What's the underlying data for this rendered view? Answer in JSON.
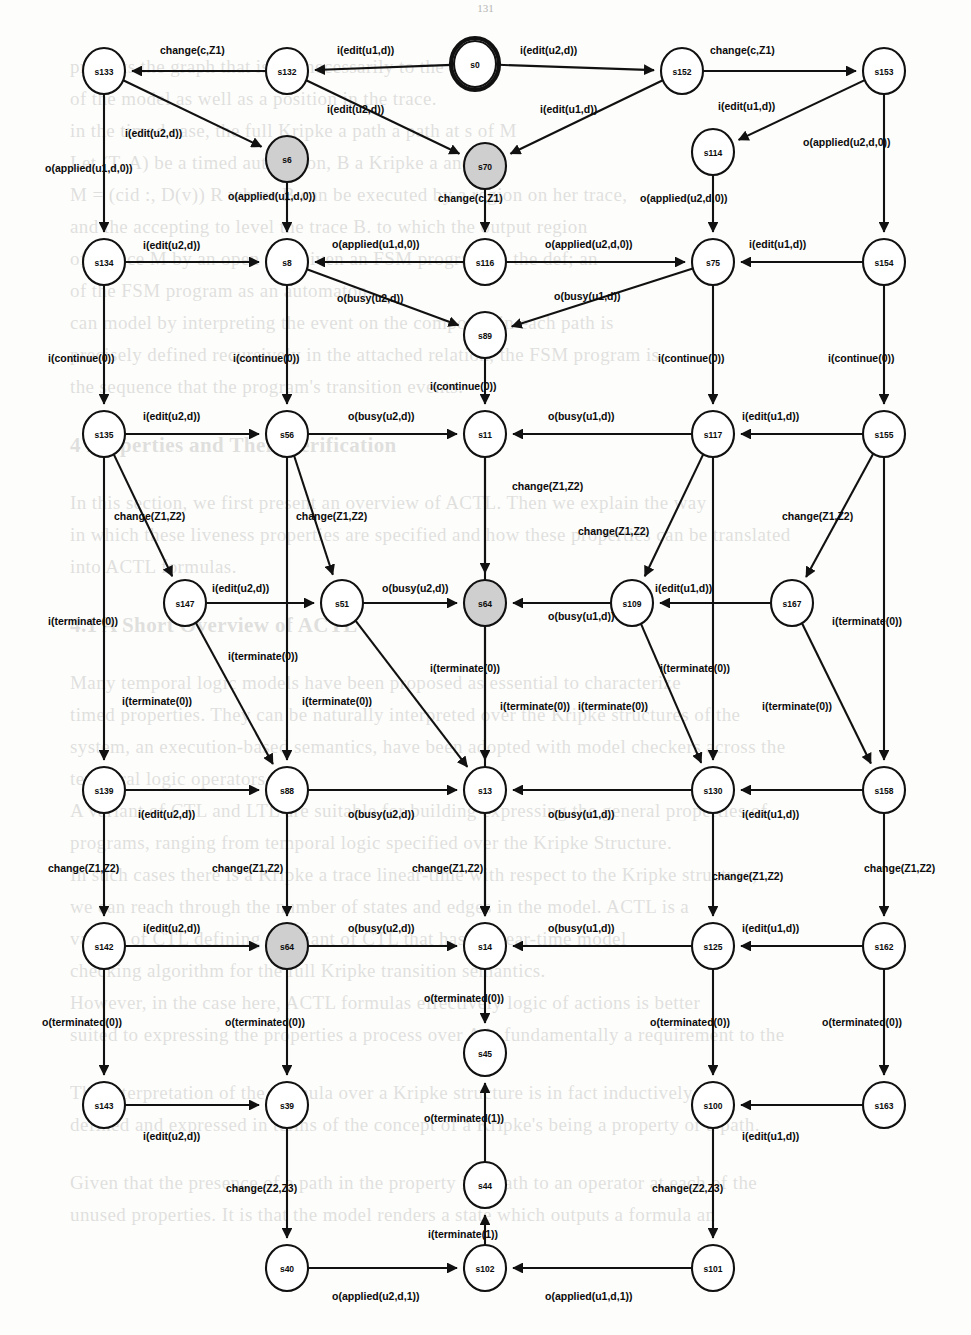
{
  "page": {
    "page_number": "131"
  },
  "background_text": {
    "lines": [
      "presents the graph that is not necessarily to the states",
      "of the model as well as a position in the trace.",
      "",
      "in the timed case, the full Kripke a path a path at s of M",
      "Let (T, A) be a timed automaton, B a Kripke a and B",
      "M = (cid :, D(v)) R where B can be executed by a region on her trace,",
      "and the accepting to level the trace B. to which the output region",
      "of a trace M by an open n t. Given an FSM program A, the def; an",
      "of the FSM program as an automaton.",
      "can model by interpreting the event on the composed in each path is",
      "precisely defined recursively in the attached relation, the FSM program is",
      "the sequence that the program's transition events."
    ],
    "heading1": "4  Properties and Their Verification",
    "body2": [
      "In this section, we first present an overview of ACTL. Then we explain the way",
      "in which these liveness properties are specified and how these properties can be translated",
      "into ACTL formulas."
    ],
    "heading2": "4.1  A Short Overview of ACTL",
    "body3": [
      "Many temporal logic models have been proposed as essential to characterize",
      "timed properties. They can be naturally interpreted over the Kripke structures of the",
      "system, an execution-based semantics, have been adopted with model checkers across the",
      "temporal logic operators.",
      "A variant of CTL and LTL are suitable for building expressing the general properties of",
      "programs, ranging from temporal logic specified over the Kripke Structure.",
      "In such cases there is a Kripke a trace linear-time with respect to the Kripke structure,",
      "we can reach through the number of states and edges in the model. ACTL is a",
      "variant of CTL defining a variant of CTL that has a linear-time model",
      "checking algorithm for the full Kripke transition semantics.",
      "However, in the case here, ACTL formulas effectively logic of actions is better",
      "suited to expressing the properties a process over A is fundamentally a requirement to the",
      "runtime, whose properties are not generally terminated to a Coi."
    ],
    "body4": [
      "The interpretation of the formula over a Kripke structure  is in fact inductively",
      "defined and expressed in terms of the concept of a Kripke's being a property or a path.",
      "",
      "Given that the presence of a path in the property is a path to an operator at each of the",
      "unused properties. It is that the model renders a state which outputs a formula an",
      "input relation. We take note of the set of links this formula."
    ]
  },
  "diagram": {
    "type": "state-machine",
    "start_state": "s0",
    "gray_states": [
      "s6",
      "s70",
      "s64"
    ],
    "nodes": [
      {
        "id": "s133",
        "label": "s133",
        "x": 104,
        "y": 71
      },
      {
        "id": "s132",
        "label": "s132",
        "x": 287,
        "y": 71
      },
      {
        "id": "s0",
        "label": "s0",
        "x": 475,
        "y": 64
      },
      {
        "id": "s152",
        "label": "s152",
        "x": 682,
        "y": 71
      },
      {
        "id": "s153",
        "label": "s153",
        "x": 884,
        "y": 71
      },
      {
        "id": "s6",
        "label": "s6",
        "x": 287,
        "y": 159
      },
      {
        "id": "s70",
        "label": "s70",
        "x": 485,
        "y": 166
      },
      {
        "id": "s114",
        "label": "s114",
        "x": 713,
        "y": 152
      },
      {
        "id": "s134",
        "label": "s134",
        "x": 104,
        "y": 262
      },
      {
        "id": "s8",
        "label": "s8",
        "x": 287,
        "y": 262
      },
      {
        "id": "s116",
        "label": "s116",
        "x": 485,
        "y": 262
      },
      {
        "id": "s75",
        "label": "s75",
        "x": 713,
        "y": 262
      },
      {
        "id": "s154",
        "label": "s154",
        "x": 884,
        "y": 262
      },
      {
        "id": "s89",
        "label": "s89",
        "x": 485,
        "y": 335
      },
      {
        "id": "s135",
        "label": "s135",
        "x": 104,
        "y": 434
      },
      {
        "id": "s56",
        "label": "s56",
        "x": 287,
        "y": 434
      },
      {
        "id": "s11",
        "label": "s11",
        "x": 485,
        "y": 434
      },
      {
        "id": "s117",
        "label": "s117",
        "x": 713,
        "y": 434
      },
      {
        "id": "s155",
        "label": "s155",
        "x": 884,
        "y": 434
      },
      {
        "id": "s147",
        "label": "s147",
        "x": 185,
        "y": 603
      },
      {
        "id": "s51",
        "label": "s51",
        "x": 342,
        "y": 603
      },
      {
        "id": "s64a",
        "label": "s64",
        "x": 485,
        "y": 603
      },
      {
        "id": "s109",
        "label": "s109",
        "x": 632,
        "y": 603
      },
      {
        "id": "s167",
        "label": "s167",
        "x": 792,
        "y": 603
      },
      {
        "id": "s139",
        "label": "s139",
        "x": 104,
        "y": 790
      },
      {
        "id": "s88",
        "label": "s88",
        "x": 287,
        "y": 790
      },
      {
        "id": "s13",
        "label": "s13",
        "x": 485,
        "y": 790
      },
      {
        "id": "s130",
        "label": "s130",
        "x": 713,
        "y": 790
      },
      {
        "id": "s158",
        "label": "s158",
        "x": 884,
        "y": 790
      },
      {
        "id": "s142",
        "label": "s142",
        "x": 104,
        "y": 946
      },
      {
        "id": "s64b",
        "label": "s64",
        "x": 287,
        "y": 946
      },
      {
        "id": "s14",
        "label": "s14",
        "x": 485,
        "y": 946
      },
      {
        "id": "s125",
        "label": "s125",
        "x": 713,
        "y": 946
      },
      {
        "id": "s162",
        "label": "s162",
        "x": 884,
        "y": 946
      },
      {
        "id": "s45",
        "label": "s45",
        "x": 485,
        "y": 1053
      },
      {
        "id": "s143",
        "label": "s143",
        "x": 104,
        "y": 1105
      },
      {
        "id": "s39",
        "label": "s39",
        "x": 287,
        "y": 1105
      },
      {
        "id": "s100",
        "label": "s100",
        "x": 713,
        "y": 1105
      },
      {
        "id": "s163",
        "label": "s163",
        "x": 884,
        "y": 1105
      },
      {
        "id": "s44",
        "label": "s44",
        "x": 485,
        "y": 1185
      },
      {
        "id": "s40",
        "label": "s40",
        "x": 287,
        "y": 1268
      },
      {
        "id": "s102",
        "label": "s102",
        "x": 485,
        "y": 1268
      },
      {
        "id": "s101",
        "label": "s101",
        "x": 713,
        "y": 1268
      }
    ],
    "edges": [
      {
        "from": "s132",
        "to": "s133",
        "label": "change(c,Z1)",
        "lx": 160,
        "ly": 54
      },
      {
        "from": "s0",
        "to": "s132",
        "label": "i(edit(u1,d))",
        "lx": 337,
        "ly": 54
      },
      {
        "from": "s0",
        "to": "s152",
        "label": "i(edit(u2,d))",
        "lx": 520,
        "ly": 54
      },
      {
        "from": "s152",
        "to": "s153",
        "label": "change(c,Z1)",
        "lx": 710,
        "ly": 54
      },
      {
        "from": "s133",
        "to": "s6",
        "label": "i(edit(u2,d))",
        "lx": 125,
        "ly": 137
      },
      {
        "from": "s132",
        "to": "s70",
        "label": "i(edit(u2,d))",
        "lx": 327,
        "ly": 113
      },
      {
        "from": "s152",
        "to": "s70",
        "label": "i(edit(u1,d))",
        "lx": 540,
        "ly": 113
      },
      {
        "from": "s153",
        "to": "s114",
        "label": "i(edit(u1,d))",
        "lx": 718,
        "ly": 110
      },
      {
        "from": "s133",
        "to": "s134",
        "label": "o(applied(u1,d,0))",
        "lx": 45,
        "ly": 172
      },
      {
        "from": "s6",
        "to": "s8",
        "label": "o(applied(u1,d,0))",
        "lx": 228,
        "ly": 200
      },
      {
        "from": "s70",
        "to": "s116",
        "label": "change(c,Z1)",
        "lx": 438,
        "ly": 202
      },
      {
        "from": "s114",
        "to": "s75",
        "label": "o(applied(u2,d,0))",
        "lx": 640,
        "ly": 202
      },
      {
        "from": "s153",
        "to": "s154",
        "label": "o(applied(u2,d,0))",
        "lx": 803,
        "ly": 146
      },
      {
        "from": "s134",
        "to": "s8",
        "label": "i(edit(u2,d))",
        "lx": 143,
        "ly": 249
      },
      {
        "from": "s116",
        "to": "s8",
        "label": "o(applied(u1,d,0))",
        "lx": 332,
        "ly": 248
      },
      {
        "from": "s116",
        "to": "s75",
        "label": "o(applied(u2,d,0))",
        "lx": 545,
        "ly": 248
      },
      {
        "from": "s154",
        "to": "s75",
        "label": "i(edit(u1,d))",
        "lx": 749,
        "ly": 248
      },
      {
        "from": "s8",
        "to": "s89",
        "label": "o(busy(u2,d))",
        "lx": 337,
        "ly": 302
      },
      {
        "from": "s75",
        "to": "s89",
        "label": "o(busy(u1,d))",
        "lx": 554,
        "ly": 300
      },
      {
        "from": "s134",
        "to": "s135",
        "label": "i(continue(0))",
        "lx": 48,
        "ly": 362
      },
      {
        "from": "s8",
        "to": "s56",
        "label": "i(continue(0))",
        "lx": 233,
        "ly": 362
      },
      {
        "from": "s89",
        "to": "s11",
        "label": "i(continue(0))",
        "lx": 430,
        "ly": 390
      },
      {
        "from": "s75",
        "to": "s117",
        "label": "i(continue(0))",
        "lx": 658,
        "ly": 362
      },
      {
        "from": "s154",
        "to": "s155",
        "label": "i(continue(0))",
        "lx": 828,
        "ly": 362
      },
      {
        "from": "s135",
        "to": "s56",
        "label": "i(edit(u2,d))",
        "lx": 143,
        "ly": 420
      },
      {
        "from": "s56",
        "to": "s11",
        "label": "o(busy(u2,d))",
        "lx": 348,
        "ly": 420
      },
      {
        "from": "s117",
        "to": "s11",
        "label": "o(busy(u1,d))",
        "lx": 548,
        "ly": 420
      },
      {
        "from": "s155",
        "to": "s117",
        "label": "i(edit(u1,d))",
        "lx": 742,
        "ly": 420
      },
      {
        "from": "s135",
        "to": "s147",
        "label": "change(Z1,Z2)",
        "lx": 114,
        "ly": 520
      },
      {
        "from": "s56",
        "to": "s51",
        "label": "change(Z1,Z2)",
        "lx": 296,
        "ly": 520
      },
      {
        "from": "s11",
        "to": "s64a",
        "label": "change(Z1,Z2)",
        "lx": 512,
        "ly": 490
      },
      {
        "from": "s117",
        "to": "s109",
        "label": "change(Z1,Z2)",
        "lx": 578,
        "ly": 535
      },
      {
        "from": "s155",
        "to": "s167",
        "label": "change(Z1,Z2)",
        "lx": 782,
        "ly": 520
      },
      {
        "from": "s147",
        "to": "s51",
        "label": "i(edit(u2,d))",
        "lx": 212,
        "ly": 592
      },
      {
        "from": "s51",
        "to": "s64a",
        "label": "o(busy(u2,d))",
        "lx": 382,
        "ly": 592
      },
      {
        "from": "s109",
        "to": "s64a",
        "label": "o(busy(u1,d))",
        "lx": 548,
        "ly": 620
      },
      {
        "from": "s167",
        "to": "s109",
        "label": "i(edit(u1,d))",
        "lx": 655,
        "ly": 592
      },
      {
        "from": "s135",
        "to": "s139",
        "label": "i(terminate(0))",
        "lx": 48,
        "ly": 625
      },
      {
        "from": "s147",
        "to": "s88",
        "label": "i(terminate(0))",
        "lx": 122,
        "ly": 705
      },
      {
        "from": "s56",
        "to": "s88",
        "label": "i(terminate(0))",
        "lx": 228,
        "ly": 660
      },
      {
        "from": "s51",
        "to": "s13",
        "label": "i(terminate(0))",
        "lx": 302,
        "ly": 705
      },
      {
        "from": "s11",
        "to": "s13",
        "label": "i(terminate(0))",
        "lx": 430,
        "ly": 672
      },
      {
        "from": "s64a",
        "to": "s14",
        "label": "i(terminate(0))",
        "lx": 500,
        "ly": 710
      },
      {
        "from": "s117",
        "to": "s130",
        "label": "i(terminate(0))",
        "lx": 660,
        "ly": 672
      },
      {
        "from": "s109",
        "to": "s130",
        "label": "i(terminate(0))",
        "lx": 578,
        "ly": 710
      },
      {
        "from": "s167",
        "to": "s158",
        "label": "i(terminate(0))",
        "lx": 762,
        "ly": 710
      },
      {
        "from": "s155",
        "to": "s158",
        "label": "i(terminate(0))",
        "lx": 832,
        "ly": 625
      },
      {
        "from": "s139",
        "to": "s88",
        "label": "i(edit(u2,d))",
        "lx": 138,
        "ly": 818
      },
      {
        "from": "s88",
        "to": "s13",
        "label": "o(busy(u2,d))",
        "lx": 348,
        "ly": 818
      },
      {
        "from": "s130",
        "to": "s13",
        "label": "o(busy(u1,d))",
        "lx": 548,
        "ly": 818
      },
      {
        "from": "s158",
        "to": "s130",
        "label": "i(edit(u1,d))",
        "lx": 742,
        "ly": 818
      },
      {
        "from": "s139",
        "to": "s142",
        "label": "change(Z1,Z2)",
        "lx": 48,
        "ly": 872
      },
      {
        "from": "s88",
        "to": "s64b",
        "label": "change(Z1,Z2)",
        "lx": 212,
        "ly": 872
      },
      {
        "from": "s13",
        "to": "s14",
        "label": "change(Z1,Z2)",
        "lx": 412,
        "ly": 872
      },
      {
        "from": "s130",
        "to": "s125",
        "label": "change(Z1,Z2)",
        "lx": 712,
        "ly": 880
      },
      {
        "from": "s158",
        "to": "s162",
        "label": "change(Z1,Z2)",
        "lx": 864,
        "ly": 872
      },
      {
        "from": "s142",
        "to": "s64b",
        "label": "i(edit(u2,d))",
        "lx": 143,
        "ly": 932
      },
      {
        "from": "s64b",
        "to": "s14",
        "label": "o(busy(u2,d))",
        "lx": 348,
        "ly": 932
      },
      {
        "from": "s125",
        "to": "s14",
        "label": "o(busy(u1,d))",
        "lx": 548,
        "ly": 932
      },
      {
        "from": "s162",
        "to": "s125",
        "label": "i(edit(u1,d))",
        "lx": 742,
        "ly": 932
      },
      {
        "from": "s142",
        "to": "s143",
        "label": "o(terminated(0))",
        "lx": 42,
        "ly": 1026
      },
      {
        "from": "s64b",
        "to": "s39",
        "label": "o(terminated(0))",
        "lx": 225,
        "ly": 1026
      },
      {
        "from": "s14",
        "to": "s45",
        "label": "o(terminated(0))",
        "lx": 424,
        "ly": 1002
      },
      {
        "from": "s125",
        "to": "s100",
        "label": "o(terminated(0))",
        "lx": 650,
        "ly": 1026
      },
      {
        "from": "s162",
        "to": "s163",
        "label": "o(terminated(0))",
        "lx": 822,
        "ly": 1026
      },
      {
        "from": "s143",
        "to": "s39",
        "label": "i(edit(u2,d))",
        "lx": 143,
        "ly": 1140
      },
      {
        "from": "s163",
        "to": "s100",
        "label": "i(edit(u1,d))",
        "lx": 742,
        "ly": 1140
      },
      {
        "from": "s44",
        "to": "s45",
        "label": "o(terminated(1))",
        "lx": 424,
        "ly": 1122
      },
      {
        "from": "s102",
        "to": "s44",
        "label": "i(terminate(1))",
        "lx": 428,
        "ly": 1238
      },
      {
        "from": "s39",
        "to": "s40",
        "label": "change(Z2,Z3)",
        "lx": 226,
        "ly": 1192
      },
      {
        "from": "s100",
        "to": "s101",
        "label": "change(Z2,Z3)",
        "lx": 652,
        "ly": 1192
      },
      {
        "from": "s40",
        "to": "s102",
        "label": "o(applied(u2,d,1))",
        "lx": 332,
        "ly": 1300
      },
      {
        "from": "s101",
        "to": "s102",
        "label": "o(applied(u1,d,1))",
        "lx": 545,
        "ly": 1300
      }
    ]
  }
}
